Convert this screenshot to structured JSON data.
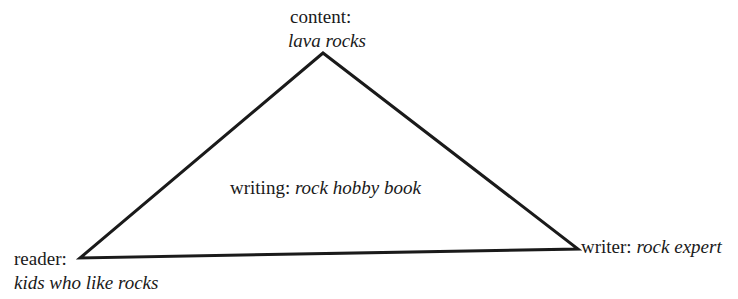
{
  "diagram": {
    "type": "rhetorical-triangle",
    "vertices": {
      "top": {
        "role": "content:",
        "value": "lava rocks"
      },
      "left": {
        "role": "reader:",
        "value": "kids who like rocks"
      },
      "right": {
        "role": "writer:",
        "value": "rock expert"
      }
    },
    "center": {
      "role": "writing:",
      "value": "rock hobby book"
    },
    "line_color": "#1a1a1a"
  }
}
